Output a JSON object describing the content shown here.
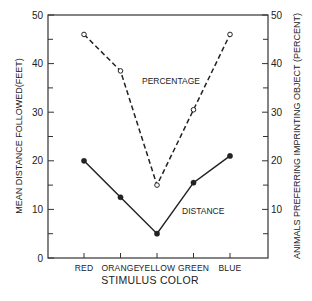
{
  "chart_data": {
    "type": "line",
    "title": "",
    "categories": [
      "RED",
      "ORANGE",
      "YELLOW",
      "GREEN",
      "BLUE"
    ],
    "xlabel": "STIMULUS COLOR",
    "ylabel": "MEAN DISTANCE FOLLOWED (FEET)",
    "ylabel_right": "ANIMALS PREFERRING IMPRINTING OBJECT (PERCENT)",
    "ylim": [
      0,
      50
    ],
    "ylim_right": [
      0,
      50
    ],
    "yticks": [
      0,
      10,
      20,
      30,
      40,
      50
    ],
    "yticks_right": [
      10,
      20,
      30,
      40,
      50
    ],
    "grid": false,
    "legend": "none",
    "series": [
      {
        "name": "PERCENTAGE",
        "axis": "right",
        "style": "dashed",
        "marker": "open-circle",
        "values": [
          46,
          38.5,
          15,
          30.5,
          46
        ]
      },
      {
        "name": "DISTANCE",
        "axis": "left",
        "style": "solid",
        "marker": "filled-circle",
        "values": [
          20,
          12.5,
          5,
          15.5,
          21
        ]
      }
    ],
    "annotations": [
      {
        "text": "PERCENTAGE",
        "series": "PERCENTAGE"
      },
      {
        "text": "DISTANCE",
        "series": "DISTANCE"
      }
    ]
  },
  "labels": {
    "left_axis_title": "MEAN DISTANCE FOLLOWED(FEET)",
    "right_axis_title": "ANIMALS PREFERRING IMPRINTING OBJECT (PERCENT)",
    "x_axis_title": "STIMULUS COLOR",
    "percentage_annotation": "PERCENTAGE",
    "distance_annotation": "DISTANCE"
  }
}
